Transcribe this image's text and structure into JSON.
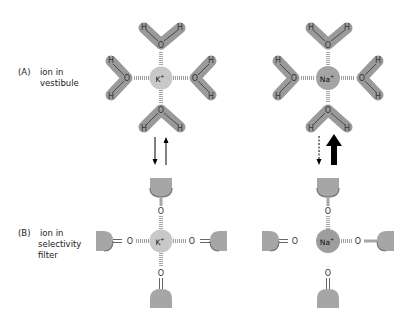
{
  "figure": {
    "row_a": {
      "letter": "(A)",
      "line1": "ion in",
      "line2": "vestibule"
    },
    "row_b": {
      "letter": "(B)",
      "line1": "ion in",
      "line2": "selectivity",
      "line3": "filter"
    },
    "ions": {
      "left": {
        "symbol": "K",
        "charge": "+"
      },
      "right": {
        "symbol": "Na",
        "charge": "+"
      }
    },
    "atoms": {
      "oxygen": "O",
      "hydrogen": "H"
    },
    "colors": {
      "water": "#9a9a9a",
      "k_ion": "#c8c8c8",
      "na_ion": "#9e9e9e",
      "carbonyl_body": "#a6a6a6",
      "arrow": "#000000"
    },
    "arrows": {
      "left": {
        "down": "thin solid",
        "up": "thin solid"
      },
      "right": {
        "down": "dashed",
        "up": "thick solid"
      }
    }
  }
}
